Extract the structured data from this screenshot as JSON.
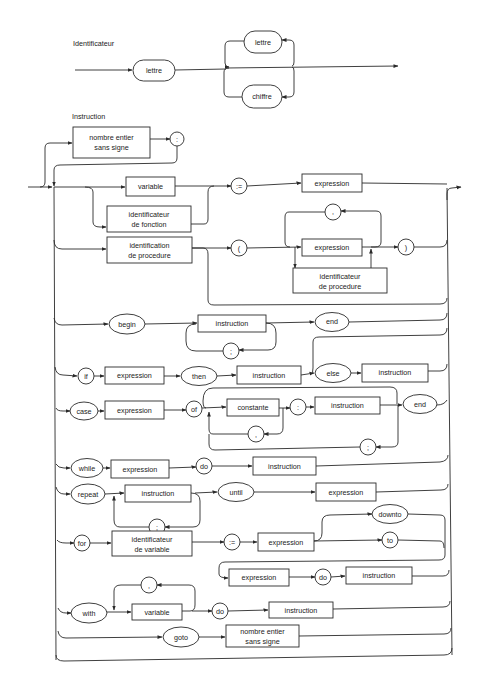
{
  "sections": {
    "identificateur": {
      "title": "Identificateur",
      "nodes": {
        "first_lettre": "lettre",
        "loop_lettre": "lettre",
        "loop_chiffre": "chiffre"
      }
    },
    "instruction": {
      "title": "Instruction",
      "label": {
        "box": [
          "nombre entier",
          "sans signe"
        ],
        "colon": ":"
      },
      "assignment": {
        "variable": "variable",
        "func_id": [
          "identificateur",
          "de fonction"
        ],
        "assign": ":=",
        "expression": "expression"
      },
      "procedure_call": {
        "proc_id": [
          "identification",
          "de procedure"
        ],
        "lparen": "(",
        "comma": ",",
        "expression": "expression",
        "proc_param": [
          "identificateur",
          "de procedure"
        ],
        "rparen": ")"
      },
      "compound": {
        "begin": "begin",
        "instruction": "instruction",
        "semicolon": ";",
        "end": "end"
      },
      "if": {
        "if": "if",
        "expression": "expression",
        "then": "then",
        "instruction": "instruction",
        "else": "else",
        "else_instruction": "instruction"
      },
      "case": {
        "case": "case",
        "expression": "expression",
        "of": "of",
        "constante": "constante",
        "comma": ",",
        "colon": ":",
        "instruction": "instruction",
        "semicolon": ";",
        "end": "end"
      },
      "while": {
        "while": "while",
        "expression": "expression",
        "do": "do",
        "instruction": "instruction"
      },
      "repeat": {
        "repeat": "repeat",
        "instruction": "instruction",
        "semicolon": ";",
        "until": "until",
        "expression": "expression"
      },
      "for": {
        "for": "for",
        "var_id": [
          "identificateur",
          "de variable"
        ],
        "assign": ":=",
        "expression": "expression",
        "downto": "downto",
        "to": "to",
        "expression2": "expression",
        "do": "do",
        "instruction": "instruction"
      },
      "with": {
        "with": "with",
        "comma": ",",
        "variable": "variable",
        "do": "do",
        "instruction": "instruction"
      },
      "goto": {
        "goto": "goto",
        "box": [
          "nombre entier",
          "sans signe"
        ]
      }
    }
  }
}
